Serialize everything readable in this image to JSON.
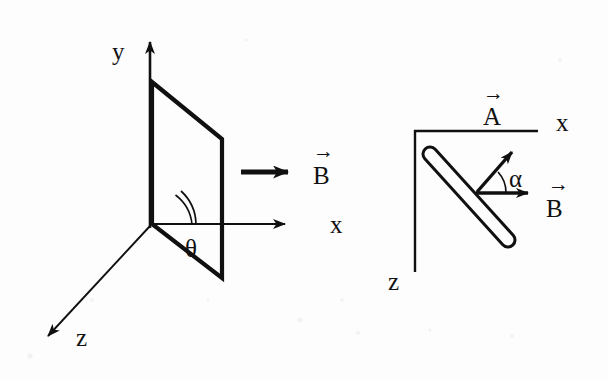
{
  "figure": {
    "background_color": "#fdfdfd",
    "ink_color": "#101010",
    "panels": [
      {
        "id": "left",
        "name": "three-dimensional-loop-view",
        "axes": [
          {
            "name": "y-axis",
            "label": "y",
            "direction": "up"
          },
          {
            "name": "x-axis",
            "label": "x",
            "direction": "right"
          },
          {
            "name": "z-axis",
            "label": "z",
            "direction": "down-left"
          }
        ],
        "shape": {
          "name": "tilted-rectangular-loop",
          "type": "parallelogram"
        },
        "angle": {
          "label": "θ",
          "between": [
            "x-axis",
            "loop-base-edge"
          ]
        },
        "vector": {
          "label": "B",
          "accent": "→",
          "direction": "right"
        }
      },
      {
        "id": "right",
        "name": "top-down-rod-view",
        "axes": [
          {
            "name": "x-axis",
            "label": "x",
            "direction": "right"
          },
          {
            "name": "z-axis",
            "label": "z",
            "direction": "down"
          }
        ],
        "shape": {
          "name": "rod",
          "type": "capsule",
          "orientation": "diagonal-down-right"
        },
        "angle": {
          "label": "α",
          "between": [
            "A-vector",
            "B-vector"
          ]
        },
        "vectors": [
          {
            "label": "A",
            "accent": "→",
            "direction": "up-right"
          },
          {
            "label": "B",
            "accent": "→",
            "direction": "right"
          }
        ]
      }
    ],
    "labels": {
      "y_left": "y",
      "x_left": "x",
      "z_left": "z",
      "theta": "θ",
      "b_left": "B",
      "a_right": "A",
      "x_right": "x",
      "z_right": "z",
      "alpha": "α",
      "b_right": "B",
      "arrow_accent": "→"
    }
  }
}
